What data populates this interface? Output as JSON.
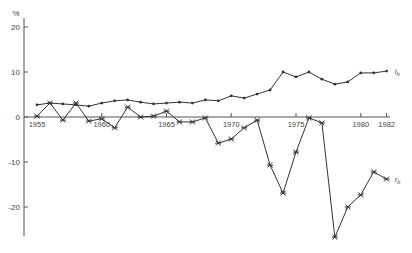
{
  "chart_data": {
    "type": "line",
    "title": "",
    "xlabel": "",
    "ylabel": "%",
    "ylim": [
      -27,
      22
    ],
    "xlim": [
      1955,
      1982
    ],
    "grid": false,
    "y_ticks": [
      20,
      10,
      0,
      -10,
      -20
    ],
    "y_tick_labels": [
      "20",
      "10",
      "0",
      "-10",
      "-20"
    ],
    "x_tick_labels": [
      "1955",
      "1960",
      "1965",
      "1970",
      "1975",
      "1980",
      "1982"
    ],
    "x_tick_values": [
      1955,
      1960,
      1965,
      1970,
      1975,
      1980,
      1982
    ],
    "x": [
      1955,
      1956,
      1957,
      1958,
      1959,
      1960,
      1961,
      1962,
      1963,
      1964,
      1965,
      1966,
      1967,
      1968,
      1969,
      1970,
      1971,
      1972,
      1973,
      1974,
      1975,
      1976,
      1977,
      1978,
      1979,
      1980,
      1981,
      1982
    ],
    "series": [
      {
        "name": "i_b",
        "label": "i",
        "label_sub": "b",
        "marker": "dot",
        "values": [
          2.7,
          3.1,
          2.9,
          2.7,
          2.4,
          3.1,
          3.6,
          3.8,
          3.3,
          2.9,
          3.1,
          3.3,
          3.1,
          3.8,
          3.6,
          4.7,
          4.2,
          5.1,
          6.0,
          10.0,
          8.9,
          10.0,
          8.4,
          7.3,
          7.8,
          9.8,
          9.8,
          10.2
        ]
      },
      {
        "name": "r_b",
        "label": "r",
        "label_sub": "b",
        "marker": "star",
        "values": [
          0.2,
          3.1,
          -0.7,
          3.1,
          -0.9,
          -0.4,
          -2.4,
          2.2,
          0.0,
          0.2,
          1.3,
          -1.1,
          -1.1,
          -0.2,
          -5.8,
          -4.9,
          -2.4,
          -0.7,
          -10.7,
          -16.9,
          -7.8,
          -0.2,
          -1.3,
          -26.7,
          -20.0,
          -17.3,
          -12.2,
          -13.8
        ]
      }
    ],
    "legend_position": "inline-right"
  },
  "colors": {
    "line": "#333333",
    "axis": "#555555",
    "text": "#444444"
  }
}
